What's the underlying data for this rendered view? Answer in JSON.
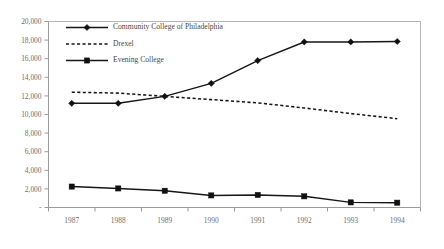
{
  "chart_data": {
    "type": "line",
    "title": "",
    "subtitle": "",
    "xlabel": "",
    "ylabel": "",
    "categories": [
      "1987",
      "1988",
      "1989",
      "1990",
      "1991",
      "1992",
      "1993",
      "1994"
    ],
    "x_tick_labels": [
      "1987",
      "1988",
      "1989",
      "1990",
      "1991",
      "1992",
      "1993",
      "1994"
    ],
    "y_tick_labels": [
      "-",
      "2,000",
      "4,000",
      "6,000",
      "8,000",
      "10,000",
      "12,000",
      "14,000",
      "16,000",
      "18,000",
      "20,000"
    ],
    "y_tick_values": [
      0,
      2000,
      4000,
      6000,
      8000,
      10000,
      12000,
      14000,
      16000,
      18000,
      20000
    ],
    "ylim": [
      0,
      20000
    ],
    "grid": false,
    "legend_position": "top-left-inside",
    "series": [
      {
        "name": "Community College of Philadelphia",
        "marker": "diamond",
        "line_style": "solid",
        "color": "#161616",
        "values": [
          11200,
          11200,
          11950,
          13350,
          15800,
          17800,
          17800,
          17850
        ]
      },
      {
        "name": "Drexel",
        "marker": "none",
        "line_style": "dotted",
        "color": "#161616",
        "values": [
          12400,
          12300,
          11950,
          11600,
          11250,
          10700,
          10100,
          9550
        ]
      },
      {
        "name": "Evening College",
        "marker": "square",
        "line_style": "solid",
        "color": "#161616",
        "values": [
          2250,
          2050,
          1800,
          1300,
          1350,
          1200,
          550,
          520
        ]
      }
    ],
    "legend_entries": [
      {
        "label": "Community College of Philadelphia",
        "marker": "diamond",
        "line_style": "solid"
      },
      {
        "label": "Drexel",
        "marker": "none",
        "line_style": "dotted"
      },
      {
        "label": "Evening College",
        "marker": "square",
        "line_style": "solid"
      }
    ],
    "colors": {
      "axis": "#9a9a9a",
      "frame": "#b5b5b5",
      "tick_text": "#6d6d6d",
      "legend_text": "#4a4a4a",
      "series_ink": "#161616",
      "background": "#ffffff"
    }
  }
}
